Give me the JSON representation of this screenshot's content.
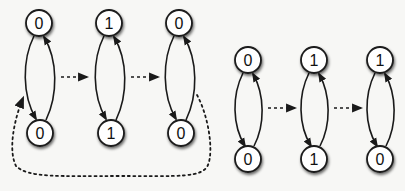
{
  "diagram": {
    "colors": {
      "background": "#f7f7f5",
      "stroke": "#1a1a1a",
      "node_fill": "#ffffff"
    },
    "groups": [
      {
        "id": "left",
        "stages": [
          {
            "top": "0",
            "bottom": "0"
          },
          {
            "top": "1",
            "bottom": "1"
          },
          {
            "top": "0",
            "bottom": "0"
          }
        ],
        "loop_back": true
      },
      {
        "id": "right",
        "stages": [
          {
            "top": "0",
            "bottom": "0"
          },
          {
            "top": "1",
            "bottom": "1"
          },
          {
            "top": "1",
            "bottom": "0"
          }
        ],
        "loop_back": false
      }
    ]
  }
}
